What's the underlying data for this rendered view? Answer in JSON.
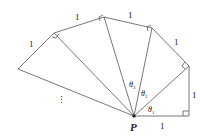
{
  "diagram": {
    "point_label": "P",
    "side_labels": [
      "1",
      "1",
      "1",
      "1",
      "1",
      "1"
    ],
    "angle_labels": [
      {
        "symbol": "θ",
        "sub": "1"
      },
      {
        "symbol": "θ",
        "sub": "2"
      },
      {
        "symbol": "θ",
        "sub": "3"
      }
    ],
    "continuation": "⋮",
    "colors": {
      "line": "#555555",
      "text": "#222222",
      "background": "#ffffff"
    }
  }
}
